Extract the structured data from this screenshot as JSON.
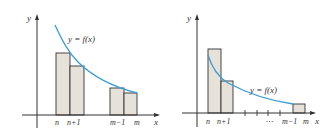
{
  "left_panel": {
    "y_label": "y",
    "x_label": "x",
    "curve_label": "y = f(x)",
    "tick_labels": [
      "n",
      "n+1",
      "m−1",
      "m"
    ],
    "bars": 4,
    "description": "Rectangles lying under/touching the curve from the left endpoints (upper sums)"
  },
  "right_panel": {
    "y_label": "y",
    "x_label": "x",
    "curve_label": "y = f(x)",
    "tick_labels": [
      "n",
      "n+1",
      "⋯",
      "m−1",
      "m"
    ],
    "bars": 3,
    "description": "Rectangles above the curve from left endpoints"
  },
  "colors": {
    "curve": "#3a9bd5",
    "bar_fill": "#e6e2da",
    "axis": "#333333"
  }
}
